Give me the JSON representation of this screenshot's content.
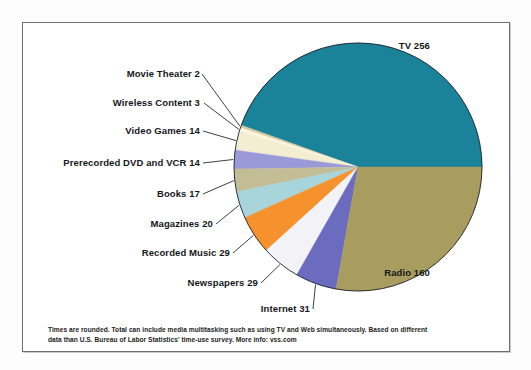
{
  "figure": {
    "frame_color": "#6d6f74",
    "background": "#ffffff"
  },
  "footnote": {
    "line1": "Times are rounded. Total can include media multitasking such as using TV and Web simultaneously. Based on different",
    "line2": "data than U.S. Bureau of Labor Statistics' time-use survey. More info: vss.com"
  },
  "labels": {
    "tv": "TV 256",
    "radio": "Radio 160",
    "movie_theater": "Movie Theater 2",
    "wireless_content": "Wireless Content 3",
    "video_games": "Video Games 14",
    "prerecorded_dvd_vcr": "Prerecorded DVD and VCR 14",
    "books": "Books 17",
    "magazines": "Magazines 20",
    "recorded_music": "Recorded Music 29",
    "newspapers": "Newspapers 29",
    "internet": "Internet 31"
  },
  "chart_data": {
    "type": "pie",
    "title": "",
    "subtitle": "",
    "units": "minutes per day",
    "total": 591,
    "start_angle_deg": 0,
    "direction": "counterclockwise",
    "legend": "none (leader-line callout labels)",
    "grid": false,
    "categories": [
      "TV",
      "Movie Theater",
      "Wireless Content",
      "Video Games",
      "Prerecorded DVD and VCR",
      "Books",
      "Magazines",
      "Recorded Music",
      "Newspapers",
      "Internet",
      "Radio"
    ],
    "values": [
      256,
      2,
      3,
      14,
      14,
      17,
      20,
      29,
      29,
      31,
      160
    ],
    "colors": [
      "#1a8299",
      "#d9c9a0",
      "#faf6e0",
      "#f3edd2",
      "#9a9ad8",
      "#c2bd94",
      "#a8d4dc",
      "#f5922e",
      "#f2f2f7",
      "#6b6bc0",
      "#a89d5e"
    ],
    "slices": [
      {
        "label": "TV 256",
        "name": "TV",
        "value": 256,
        "color": "#1a8299",
        "percent": 43.3
      },
      {
        "label": "Movie Theater 2",
        "name": "Movie Theater",
        "value": 2,
        "color": "#d9c9a0",
        "percent": 0.3
      },
      {
        "label": "Wireless Content 3",
        "name": "Wireless Content",
        "value": 3,
        "color": "#faf6e0",
        "percent": 0.5
      },
      {
        "label": "Video Games 14",
        "name": "Video Games",
        "value": 14,
        "color": "#f3edd2",
        "percent": 2.4
      },
      {
        "label": "Prerecorded DVD and VCR 14",
        "name": "Prerecorded DVD and VCR",
        "value": 14,
        "color": "#9a9ad8",
        "percent": 2.4
      },
      {
        "label": "Books 17",
        "name": "Books",
        "value": 17,
        "color": "#c2bd94",
        "percent": 2.9
      },
      {
        "label": "Magazines 20",
        "name": "Magazines",
        "value": 20,
        "color": "#a8d4dc",
        "percent": 3.4
      },
      {
        "label": "Recorded Music 29",
        "name": "Recorded Music",
        "value": 29,
        "color": "#f5922e",
        "percent": 4.9
      },
      {
        "label": "Newspapers 29",
        "name": "Newspapers",
        "value": 29,
        "color": "#f2f2f7",
        "percent": 4.9
      },
      {
        "label": "Internet 31",
        "name": "Internet",
        "value": 31,
        "color": "#6b6bc0",
        "percent": 5.2
      },
      {
        "label": "Radio 160",
        "name": "Radio",
        "value": 160,
        "color": "#a89d5e",
        "percent": 27.1
      }
    ]
  }
}
